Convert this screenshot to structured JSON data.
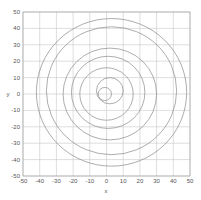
{
  "chart_data": {
    "type": "line",
    "title": "",
    "xlabel": "x",
    "ylabel": "y",
    "xlim": [
      -50,
      50
    ],
    "ylim": [
      -50,
      50
    ],
    "grid": true,
    "legend": null,
    "x_ticks": [
      -50,
      -40,
      -30,
      -20,
      -10,
      0,
      10,
      20,
      30,
      40,
      50
    ],
    "y_ticks": [
      -50,
      -40,
      -30,
      -20,
      -10,
      0,
      10,
      20,
      30,
      40,
      50
    ],
    "series": [
      {
        "name": "circle-1",
        "shape": "circle",
        "center": [
          3,
          1
        ],
        "radius": 45
      },
      {
        "name": "circle-2",
        "shape": "circle",
        "center": [
          3,
          2
        ],
        "radius": 39
      },
      {
        "name": "circle-3",
        "shape": "circle",
        "center": [
          2,
          0
        ],
        "radius": 28
      },
      {
        "name": "circle-4",
        "shape": "circle",
        "center": [
          1,
          1
        ],
        "radius": 22
      },
      {
        "name": "circle-5",
        "shape": "circle",
        "center": [
          0,
          0
        ],
        "radius": 16
      },
      {
        "name": "circle-6",
        "shape": "circle",
        "center": [
          2,
          2
        ],
        "radius": 8
      },
      {
        "name": "circle-7",
        "shape": "circle",
        "center": [
          -1,
          0
        ],
        "radius": 4
      }
    ],
    "colors": {
      "line": "#8a8a8a",
      "grid": "#c8c8c8",
      "axis": "#999999"
    }
  }
}
